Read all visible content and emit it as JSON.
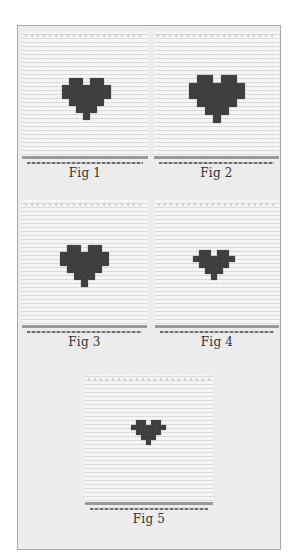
{
  "plate": {
    "background": "#ececec",
    "border_color": "#a9a9a9",
    "stitch_color": "#3f3f3f",
    "fabric_color": "#f3f3f3"
  },
  "figures": [
    {
      "caption": "Fig 1",
      "heart_pattern": [
        "0110110",
        "1111111",
        "1111111",
        "0111110",
        "0011100",
        "0001000"
      ]
    },
    {
      "caption": "Fig 2",
      "heart_pattern": [
        "0110110",
        "1111111",
        "1111111",
        "0111110",
        "0011100",
        "0001000"
      ]
    },
    {
      "caption": "Fig 3",
      "heart_pattern": [
        "0110110",
        "1111111",
        "1111111",
        "0111110",
        "0011100",
        "0001000"
      ]
    },
    {
      "caption": "Fig 4",
      "heart_pattern": [
        "0110110",
        "1111111",
        "0111110",
        "0011100",
        "0001000"
      ]
    },
    {
      "caption": "Fig 5",
      "heart_pattern": [
        "0110110",
        "1111111",
        "0111110",
        "0011100",
        "0001000"
      ]
    }
  ]
}
